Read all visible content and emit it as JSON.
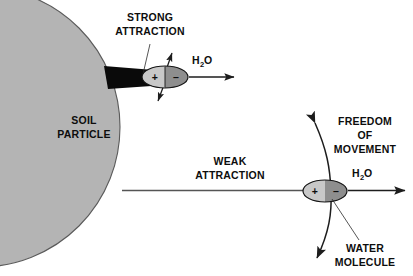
{
  "figure": {
    "type": "diagram",
    "background_color": "#ffffff",
    "line_color": "#2b2b2b"
  },
  "soil_particle": {
    "label_line1": "SOIL",
    "label_line2": "PARTICLE",
    "fill_color": "#b4b4b4",
    "stroke_color": "#5a5a5a",
    "center_x": -20,
    "center_y": 127,
    "radius": 140
  },
  "strong_attraction": {
    "label_line1": "STRONG",
    "label_line2": "ATTRACTION",
    "wedge_color": "#0a0a0a",
    "leader_from_x": 150,
    "leader_from_y": 44,
    "leader_to_x": 143,
    "leader_to_y": 74
  },
  "weak_attraction": {
    "label_line1": "WEAK",
    "label_line2": "ATTRACTION",
    "line_color": "#555555"
  },
  "freedom_of_movement": {
    "label_line1": "FREEDOM",
    "label_line2": "OF",
    "label_line3": "MOVEMENT"
  },
  "water_molecule_label": {
    "label_line1": "WATER",
    "label_line2": "MOLECULE"
  },
  "molecules": [
    {
      "id": "adsorbed-water-molecule",
      "position_x": 165,
      "position_y": 77,
      "rx": 23,
      "ry": 11,
      "positive_sign": "+",
      "negative_sign": "–",
      "positive_fill": "#c8c8c8",
      "negative_fill": "#8e8e8e",
      "stroke_color": "#1a1a1a",
      "formula_main": "H",
      "formula_sub": "2",
      "formula_tail": "O"
    },
    {
      "id": "free-water-molecule",
      "position_x": 325,
      "position_y": 191,
      "rx": 22,
      "ry": 11,
      "positive_sign": "+",
      "negative_sign": "–",
      "positive_fill": "#c8c8c8",
      "negative_fill": "#8e8e8e",
      "stroke_color": "#1a1a1a",
      "formula_main": "H",
      "formula_sub": "2",
      "formula_tail": "O"
    }
  ],
  "arrows": {
    "top_h2o_right": {
      "from_x": 190,
      "from_y": 77,
      "to_x": 233,
      "to_y": 77
    },
    "top_vibration_up": {
      "from_x": 163,
      "from_y": 79,
      "to_x": 172,
      "to_y": 54
    },
    "top_vibration_down": {
      "from_x": 167,
      "from_y": 76,
      "to_x": 158,
      "to_y": 100
    },
    "bottom_h2o_right": {
      "from_x": 348,
      "from_y": 191,
      "to_x": 404,
      "to_y": 191
    },
    "bottom_curve_description": "double-headed curved arrow through free water molecule"
  }
}
